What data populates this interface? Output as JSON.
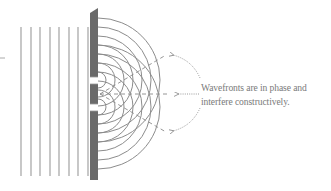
{
  "figure": {
    "caption_lines": [
      "Wavefronts are in phase and",
      "interfere constructively."
    ],
    "colors": {
      "wave_lines": "#9a9a9a",
      "barrier": "#6a6a6a",
      "arcs": "#8c8c8c",
      "dashed_lines": "#8a8a8a",
      "arrows": "#9a9a9a",
      "caption_text": "#7a7a7a"
    },
    "plane_wave_count": 8,
    "slit_count": 2,
    "dashed_ray_count": 3,
    "annotation_arrow_count": 3
  }
}
